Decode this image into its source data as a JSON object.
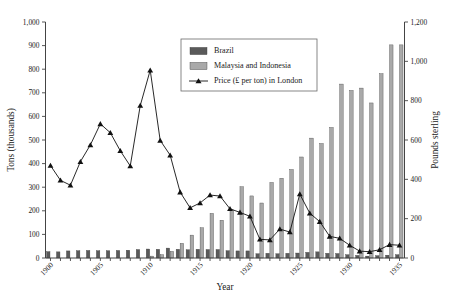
{
  "chart_data": {
    "type": "bar",
    "title": "",
    "subtitle": "",
    "xlabel": "Year",
    "ylabel": "Tons (thousands)",
    "y2label": "Pounds sterling",
    "ylim": [
      0,
      1000
    ],
    "y2lim": [
      0,
      1200
    ],
    "ytick_values": [
      0,
      100,
      200,
      300,
      400,
      500,
      600,
      700,
      800,
      900,
      1000
    ],
    "ytick_labels": [
      "0",
      "100",
      "200",
      "300",
      "400",
      "500",
      "600",
      "700",
      "800",
      "900",
      "1,000"
    ],
    "y2tick_values": [
      0,
      200,
      400,
      600,
      800,
      1000,
      1200
    ],
    "y2tick_labels": [
      "0",
      "200",
      "400",
      "600",
      "800",
      "1,000",
      "1,200"
    ],
    "grid": false,
    "legend_position": "upper-center",
    "x": [
      1900,
      1901,
      1902,
      1903,
      1904,
      1905,
      1906,
      1907,
      1908,
      1909,
      1910,
      1911,
      1912,
      1913,
      1914,
      1915,
      1916,
      1917,
      1918,
      1919,
      1920,
      1921,
      1922,
      1923,
      1924,
      1925,
      1926,
      1927,
      1928,
      1929,
      1930,
      1931,
      1932,
      1933,
      1934,
      1935
    ],
    "xtick_values": [
      1900,
      1905,
      1910,
      1915,
      1920,
      1925,
      1930,
      1935
    ],
    "xtick_labels": [
      "1900",
      "1905",
      "1910",
      "1915",
      "1920",
      "1925",
      "1930",
      "1935"
    ],
    "series": [
      {
        "name": "Brazil",
        "kind": "bar",
        "axis": "left",
        "color": "#5a5a5a",
        "values": [
          27,
          26,
          30,
          31,
          32,
          31,
          31,
          32,
          33,
          36,
          38,
          37,
          42,
          37,
          35,
          37,
          36,
          36,
          31,
          30,
          30,
          18,
          20,
          18,
          20,
          21,
          24,
          26,
          20,
          19,
          14,
          11,
          8,
          10,
          12,
          14
        ]
      },
      {
        "name": "Malaysia and Indonesia",
        "kind": "bar",
        "axis": "left",
        "color": "#a9a9a9",
        "values": [
          0,
          0,
          0,
          0,
          0,
          0,
          0,
          0,
          0,
          0,
          8,
          14,
          28,
          62,
          97,
          128,
          189,
          160,
          204,
          302,
          263,
          233,
          320,
          338,
          375,
          428,
          508,
          485,
          553,
          737,
          710,
          720,
          657,
          781,
          903,
          903
        ]
      },
      {
        "name": "Price (£ per ton) in London",
        "kind": "line",
        "axis": "right",
        "color": "#111111",
        "marker": "triangle",
        "values": [
          470,
          395,
          370,
          490,
          575,
          682,
          637,
          545,
          468,
          775,
          955,
          598,
          523,
          335,
          255,
          280,
          320,
          315,
          250,
          232,
          212,
          95,
          92,
          147,
          132,
          325,
          228,
          185,
          110,
          100,
          65,
          35,
          32,
          42,
          68,
          65
        ]
      }
    ]
  }
}
